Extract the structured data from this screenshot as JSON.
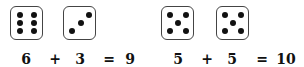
{
  "equations": [
    {
      "dice": [
        6,
        3
      ],
      "tokens": [
        "6",
        "+",
        "3",
        "=",
        "9"
      ]
    },
    {
      "dice": [
        5,
        5
      ],
      "tokens": [
        "5",
        "+",
        "5",
        "=",
        "10"
      ]
    }
  ],
  "colors": {
    "pip": "#111111",
    "border": "#444444",
    "text": "#111111"
  }
}
